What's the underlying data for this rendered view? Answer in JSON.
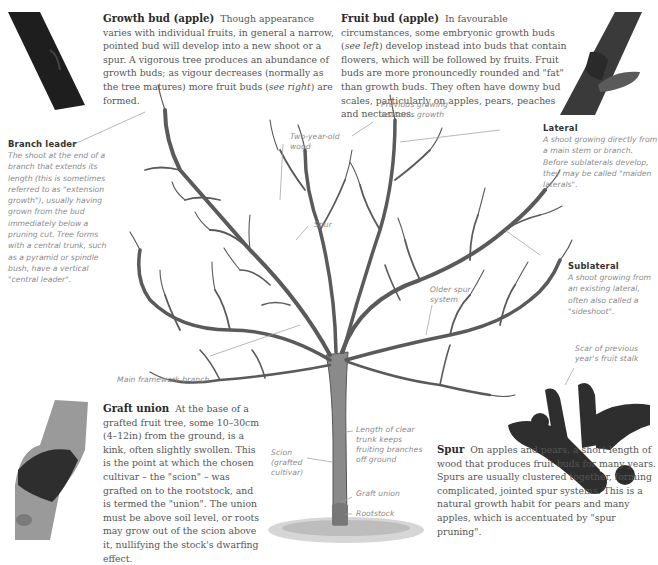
{
  "growth_bud": {
    "title": "Growth bud (apple)",
    "text": "Though appearance varies with individual fruits, in general a narrow, pointed bud will develop into a new shoot or a spur. A vigorous tree produces an abundance of growth buds; as vigour decreases (normally as the tree matures) more fruit buds",
    "italic_ref": "see right",
    "text_end": "are formed."
  },
  "fruit_bud": {
    "title": "Fruit bud (apple)",
    "text_start": "In favourable circumstances, some embryonic growth buds (",
    "italic_ref": "see left",
    "text": ") develop instead into buds that contain flowers, which will be followed by fruits. Fruit buds are more pronouncedly rounded and \"fat\" than growth buds. They often have downy bud scales, particularly on apples, pears, peaches and nectarines."
  },
  "branch_leader": {
    "title": "Branch leader",
    "text": "The shoot at the end of a branch that extends its length (this is sometimes referred to as \"extension growth\"), usually having grown from the bud immediately below a pruning cut. Tree forms with a central trunk, such as a pyramid or spindle bush, have a vertical \"central leader\"."
  },
  "lateral": {
    "title": "Lateral",
    "text": "A shoot growing directly from a main stem or branch. Before sublaterals develop, they may be called \"maiden laterals\"."
  },
  "sublateral": {
    "title": "Sublateral",
    "text": "A shoot growing from an existing lateral, often also called a \"sideshoot\"."
  },
  "graft_union": {
    "title": "Graft union",
    "text": "At the base of a grafted fruit tree, some 10–30cm (4–12in) from the ground, is a kink, often slightly swollen. This is the point at which the chosen cultivar – the \"scion\" – was grafted on to the rootstock, and is termed the \"union\". The union must be above soil level, or roots may grow out of the scion above it, nullifying the stock's dwarfing effect."
  },
  "spur": {
    "title": "Spur",
    "text": "On apples and pears, a short length of wood that produces fruit buds for many years. Spurs are usually clustered together, forming complicated, jointed spur systems. This is a natural growth habit for pears and many apples, which is accentuated by \"spur pruning\"."
  },
  "labels": {
    "previous_growth": "Previous growing season's growth",
    "two_year_old": "Two-year-old wood",
    "spur": "Spur",
    "older_spur": "Older spur system",
    "main_framework": "Main framework branch",
    "scar": "Scar of previous year's fruit stalk",
    "scion": "Scion (grafted cultivar)",
    "clear_trunk": "Length of clear trunk keeps fruiting branches off ground",
    "graft_union": "Graft union",
    "rootstock": "Rootstock"
  },
  "images": {
    "growth_bud_photo": "growth-bud-photo",
    "fruit_bud_photo": "fruit-bud-photo",
    "graft_union_photo": "graft-union-photo",
    "spur_photo": "spur-photo",
    "tree_illustration": "apple-tree-illustration"
  },
  "colors": {
    "body_text": "#555555",
    "heading_text": "#2b2b2b",
    "label_text": "#8a8a8a",
    "leader_line": "#9a9a9a",
    "bark": "#555555"
  }
}
